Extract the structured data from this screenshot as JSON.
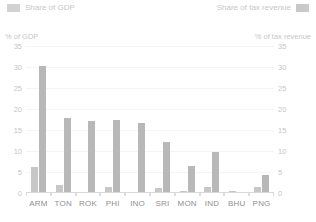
{
  "legend": {
    "gdp": {
      "label": "Share of GDP",
      "swatch_icon": "legend-swatch-icon",
      "color": "#d2d2d2"
    },
    "tax": {
      "label": "Share of tax revenue",
      "swatch_icon": "legend-swatch-icon",
      "color": "#c9c9c9"
    }
  },
  "axes": {
    "left_caption": "% of GDP",
    "right_caption": "% of tax revenue"
  },
  "chart_data": {
    "type": "bar",
    "title": "",
    "subtitle": "",
    "xlabel": "",
    "ylabel": "% of GDP",
    "y2label": "% of tax revenue",
    "categories": [
      "ARM",
      "TON",
      "ROK",
      "PHI",
      "INO",
      "SRI",
      "MON",
      "IND",
      "BHU",
      "PNG"
    ],
    "series": [
      {
        "name": "Share of GDP",
        "axis": "left",
        "color": "#c7c7c7",
        "values": [
          6.2,
          1.8,
          0,
          1.5,
          0,
          1.2,
          0.5,
          1.5,
          0.4,
          1.5
        ]
      },
      {
        "name": "Share of tax revenue",
        "axis": "right",
        "color": "#b8b8b8",
        "values": [
          30.2,
          17.8,
          17.2,
          17.5,
          16.6,
          12.2,
          6.5,
          9.8,
          0,
          4.2
        ]
      }
    ],
    "ylim": [
      0,
      35
    ],
    "y2lim": [
      0,
      35
    ],
    "yticks": [
      0,
      5,
      10,
      15,
      20,
      25,
      30,
      35
    ],
    "y2ticks": [
      0,
      5,
      10,
      15,
      20,
      25,
      30,
      35
    ],
    "grid": true,
    "legend_position": "top"
  }
}
